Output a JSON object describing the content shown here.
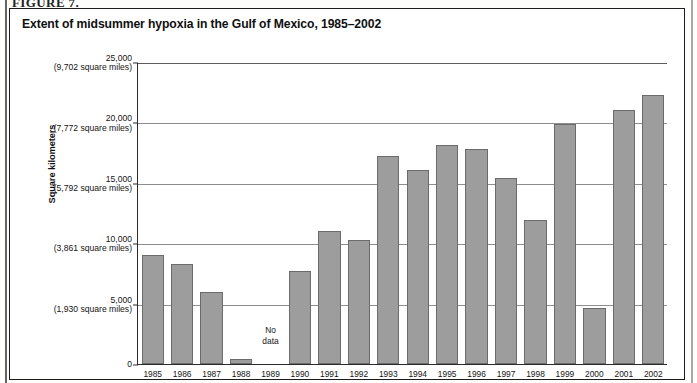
{
  "figure_caption": "FIGURE 7.",
  "chart_title": "Extent of midsummer hypoxia in the Gulf of Mexico, 1985–2002",
  "axis": {
    "y_title": "Square kilometers",
    "y_ticks": [
      {
        "km": "25,000",
        "miles": "(9,702 square miles)",
        "value": 25000
      },
      {
        "km": "20,000",
        "miles": "(7,772 square miles)",
        "value": 20000
      },
      {
        "km": "15,000",
        "miles": "(5,792 square miles)",
        "value": 15000
      },
      {
        "km": "10,000",
        "miles": "(3,861 square miles)",
        "value": 10000
      },
      {
        "km": "5,000",
        "miles": "(1,930 square miles)",
        "value": 5000
      },
      {
        "km": "0",
        "miles": "",
        "value": 0
      }
    ]
  },
  "no_data_label": "No\ndata",
  "colors": {
    "bar_fill": "#9d9d9d",
    "bar_stroke": "#6b6b6b",
    "gridline": "#8d8d8d",
    "axis": "#2b2b2b",
    "frame": "#1d1d1d",
    "text": "#111111"
  },
  "chart_data": {
    "type": "bar",
    "title": "Extent of midsummer hypoxia in the Gulf of Mexico, 1985–2002",
    "xlabel": "",
    "ylabel": "Square kilometers",
    "ylim": [
      0,
      25000
    ],
    "ytick_values": [
      0,
      5000,
      10000,
      15000,
      20000,
      25000
    ],
    "grid": true,
    "legend": "none",
    "units_primary": "square kilometers",
    "units_secondary": "square miles",
    "categories": [
      "1985",
      "1986",
      "1987",
      "1988",
      "1989",
      "1990",
      "1991",
      "1992",
      "1993",
      "1994",
      "1995",
      "1996",
      "1997",
      "1998",
      "1999",
      "2000",
      "2001",
      "2002"
    ],
    "values": [
      9000,
      8300,
      6000,
      400,
      null,
      7700,
      11000,
      10300,
      17200,
      16100,
      18100,
      17800,
      15400,
      11900,
      19900,
      4600,
      21000,
      22300
    ],
    "annotations": [
      {
        "category": "1989",
        "text": "No data"
      }
    ]
  }
}
